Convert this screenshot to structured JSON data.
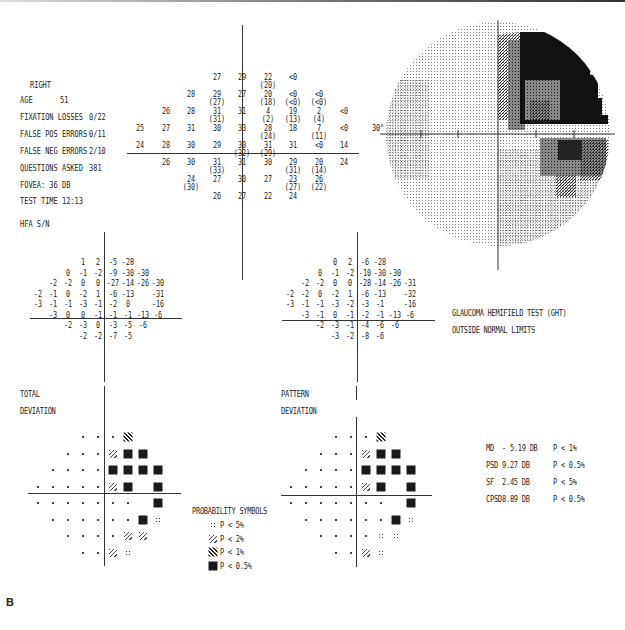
{
  "header": {
    "eye": "RIGHT",
    "age_label": "AGE",
    "age": "51",
    "fixation_label": "FIXATION LOSSES",
    "fixation": "0/22",
    "false_pos_label": "FALSE POS ERRORS",
    "false_pos": "0/11",
    "false_neg_label": "FALSE NEG ERRORS",
    "false_neg": "2/10",
    "questions_label": "QUESTIONS ASKED",
    "questions": "381",
    "fovea": "FOVEA: 36 DB",
    "test_time": "TEST TIME 12:13",
    "hfa": "HFA S/N"
  },
  "greyscale": {
    "angle_label": "30°"
  },
  "ght": {
    "line1": "GLAUCOMA HEMIFIELD TEST (GHT)",
    "line2": "OUTSIDE NORMAL LIMITS"
  },
  "total_deviation": {
    "label1": "TOTAL",
    "label2": "DEVIATION"
  },
  "pattern_deviation": {
    "label1": "PATTERN",
    "label2": "DEVIATION"
  },
  "probability_symbols": {
    "title": "PROBABILITY SYMBOLS",
    "items": [
      {
        "symbol": "p5",
        "text": "P <  5%"
      },
      {
        "symbol": "p2",
        "text": "P <  2%"
      },
      {
        "symbol": "p1",
        "text": "P <  1%"
      },
      {
        "symbol": "p05",
        "text": "P < 0.5%"
      }
    ]
  },
  "global_indices": [
    {
      "name": "MD",
      "value": "- 5.19 DB",
      "p": "P <  1%"
    },
    {
      "name": "PSD",
      "value": "9.27 DB",
      "p": "P < 0.5%"
    },
    {
      "name": "SF",
      "value": "2.45 DB",
      "p": "P <  5%"
    },
    {
      "name": "CPSD",
      "value": "8.89 DB",
      "p": "P < 0.5%"
    }
  ],
  "figure_label": "B",
  "chart_data": [
    {
      "type": "table",
      "title": "Threshold values (dB), right eye 30-2",
      "rows": [
        [
          "",
          "",
          "",
          "27",
          "29",
          "22 (20)",
          "<0",
          "",
          "",
          ""
        ],
        [
          "",
          "",
          "28",
          "29 (27)",
          "27",
          "20 (18)",
          "<0 (<0)",
          "<0 (<0)",
          "",
          ""
        ],
        [
          "",
          "26",
          "28",
          "31 (31)",
          "31",
          "4 (2)",
          "19 (13)",
          "2 (4)",
          "<0",
          ""
        ],
        [
          "25",
          "27",
          "31",
          "30",
          "33",
          "28 (24)",
          "18",
          "7 (11)",
          "<0",
          ""
        ],
        [
          "24",
          "28",
          "30",
          "29",
          "30 (32)",
          "31 (29)",
          "31",
          "<0",
          "14",
          ""
        ],
        [
          "",
          "26",
          "30",
          "31 (33)",
          "31",
          "30",
          "29 (31)",
          "20 (14)",
          "24",
          ""
        ],
        [
          "",
          "",
          "24 (30)",
          "27",
          "30",
          "27",
          "23 (27)",
          "26 (22)",
          "",
          ""
        ],
        [
          "",
          "",
          "",
          "26",
          "27",
          "22",
          "24",
          "",
          "",
          ""
        ]
      ]
    },
    {
      "type": "table",
      "title": "Total Deviation",
      "rows": [
        [
          "",
          "",
          "",
          "1",
          "2",
          "-5",
          "-28",
          "",
          "",
          ""
        ],
        [
          "",
          "",
          "0",
          "-1",
          "-2",
          "-9",
          "-30",
          "-30",
          "",
          ""
        ],
        [
          "",
          "-2",
          "-2",
          "0",
          "0",
          "-27",
          "-14",
          "-26",
          "-30",
          ""
        ],
        [
          "-2",
          "-1",
          "0",
          "-2",
          "1",
          "-6",
          "-13",
          "",
          "-31",
          ""
        ],
        [
          "-3",
          "-1",
          "-1",
          "-3",
          "-1",
          "-2",
          "0",
          "",
          "-16",
          ""
        ],
        [
          "",
          "-3",
          "0",
          "0",
          "-1",
          "-1",
          "-1",
          "-13",
          "-6",
          ""
        ],
        [
          "",
          "",
          "-2",
          "-3",
          "0",
          "-3",
          "-5",
          "-6",
          "",
          ""
        ],
        [
          "",
          "",
          "",
          "-2",
          "-2",
          "-7",
          "-5",
          "",
          "",
          ""
        ]
      ]
    },
    {
      "type": "table",
      "title": "Pattern Deviation",
      "rows": [
        [
          "",
          "",
          "",
          "0",
          "2",
          "-6",
          "-28",
          "",
          "",
          ""
        ],
        [
          "",
          "",
          "0",
          "-1",
          "-2",
          "-10",
          "-30",
          "-30",
          "",
          ""
        ],
        [
          "",
          "-2",
          "-2",
          "0",
          "0",
          "-28",
          "-14",
          "-26",
          "-31",
          ""
        ],
        [
          "-2",
          "-2",
          "0",
          "-2",
          "1",
          "-6",
          "-13",
          "",
          "-32",
          ""
        ],
        [
          "-3",
          "-1",
          "-1",
          "-3",
          "-2",
          "-3",
          "-1",
          "",
          "-16",
          ""
        ],
        [
          "",
          "-3",
          "-1",
          "0",
          "-1",
          "-2",
          "-1",
          "-13",
          "-6",
          ""
        ],
        [
          "",
          "",
          "-2",
          "-3",
          "-1",
          "-4",
          "-6",
          "-6",
          "",
          ""
        ],
        [
          "",
          "",
          "",
          "-3",
          "-2",
          "-8",
          "-6",
          "",
          "",
          ""
        ]
      ]
    },
    {
      "type": "heatmap",
      "title": "Total Deviation probability plot",
      "legend": {
        "dot": "normal",
        "p5": "P<5%",
        "p2": "P<2%",
        "p1": "P<1%",
        "p05": "P<0.5%"
      },
      "rows": [
        [
          "",
          "",
          "",
          "dot",
          "dot",
          "dot",
          "p1",
          "",
          "",
          ""
        ],
        [
          "",
          "",
          "dot",
          "dot",
          "dot",
          "p2",
          "p05",
          "p05",
          "",
          ""
        ],
        [
          "",
          "dot",
          "dot",
          "dot",
          "dot",
          "p05",
          "p05",
          "p05",
          "p05",
          ""
        ],
        [
          "dot",
          "dot",
          "dot",
          "dot",
          "dot",
          "p2",
          "p05",
          "",
          "p05",
          ""
        ],
        [
          "dot",
          "dot",
          "dot",
          "dot",
          "dot",
          "dot",
          "dot",
          "",
          "p05",
          ""
        ],
        [
          "",
          "dot",
          "dot",
          "dot",
          "dot",
          "dot",
          "dot",
          "p05",
          "p5",
          ""
        ],
        [
          "",
          "",
          "dot",
          "dot",
          "dot",
          "dot",
          "p2",
          "p2",
          "",
          ""
        ],
        [
          "",
          "",
          "",
          "dot",
          "dot",
          "p2",
          "p5",
          "",
          "",
          ""
        ]
      ]
    },
    {
      "type": "heatmap",
      "title": "Pattern Deviation probability plot",
      "rows": [
        [
          "",
          "",
          "",
          "dot",
          "dot",
          "dot",
          "p1",
          "",
          "",
          ""
        ],
        [
          "",
          "",
          "dot",
          "dot",
          "dot",
          "p2",
          "p05",
          "p05",
          "",
          ""
        ],
        [
          "",
          "dot",
          "dot",
          "dot",
          "dot",
          "p05",
          "p05",
          "p05",
          "p05",
          ""
        ],
        [
          "dot",
          "dot",
          "dot",
          "dot",
          "dot",
          "p2",
          "p05",
          "",
          "p05",
          ""
        ],
        [
          "dot",
          "dot",
          "dot",
          "dot",
          "dot",
          "dot",
          "dot",
          "",
          "p05",
          ""
        ],
        [
          "",
          "dot",
          "dot",
          "dot",
          "dot",
          "dot",
          "dot",
          "p05",
          "p5",
          ""
        ],
        [
          "",
          "",
          "dot",
          "dot",
          "dot",
          "dot",
          "p5",
          "p5",
          "",
          ""
        ],
        [
          "",
          "",
          "",
          "dot",
          "dot",
          "p2",
          "p5",
          "",
          "",
          ""
        ]
      ]
    }
  ]
}
